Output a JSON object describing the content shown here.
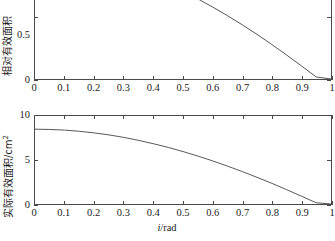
{
  "figure": {
    "background": "#ffffff",
    "line_color": "#555555",
    "axis_color": "#4a4a4a"
  },
  "charts": [
    {
      "id": "top",
      "ylabel": "相对有效面积",
      "xlabel": "",
      "x_ticks": [
        "0",
        "0.1",
        "0.2",
        "0.3",
        "0.4",
        "0.5",
        "0.6",
        "0.7",
        "0.8",
        "0.9",
        "1"
      ],
      "x_tick_values": [
        0,
        0.1,
        0.2,
        0.3,
        0.4,
        0.5,
        0.6,
        0.7,
        0.8,
        0.9,
        1
      ],
      "y_ticks": [
        "0",
        "0.5"
      ],
      "y_tick_values": [
        0,
        0.5
      ],
      "cropped_top": true
    },
    {
      "id": "bottom",
      "ylabel_main": "实际有效面积/cm",
      "ylabel_sup": "2",
      "xlabel_italic": "i",
      "xlabel_rest": "/rad",
      "x_ticks": [
        "0",
        "0.1",
        "0.2",
        "0.3",
        "0.4",
        "0.5",
        "0.6",
        "0.7",
        "0.8",
        "0.9",
        "1"
      ],
      "x_tick_values": [
        0,
        0.1,
        0.2,
        0.3,
        0.4,
        0.5,
        0.6,
        0.7,
        0.8,
        0.9,
        1
      ],
      "y_ticks": [
        "0",
        "5",
        "10"
      ],
      "y_tick_values": [
        0,
        5,
        10
      ],
      "cropped_top": false
    }
  ],
  "chart_data": [
    {
      "type": "line",
      "id": "relative-effective-area",
      "title": "",
      "xlabel": "",
      "ylabel": "相对有效面积",
      "xlim": [
        0,
        1
      ],
      "ylim": [
        0,
        1
      ],
      "grid": false,
      "legend": "none",
      "note": "Top panel is cropped by the screenshot: the plot box extends above the image top edge, so only y ticks 0 and 0.5 are visible.",
      "x": [
        0.0,
        0.05,
        0.1,
        0.15,
        0.2,
        0.25,
        0.3,
        0.35,
        0.4,
        0.45,
        0.5,
        0.55,
        0.6,
        0.65,
        0.7,
        0.75,
        0.8,
        0.85,
        0.9,
        0.95,
        1.0
      ],
      "y": [
        1.0,
        0.997,
        0.988,
        0.972,
        0.951,
        0.923,
        0.89,
        0.851,
        0.806,
        0.756,
        0.701,
        0.641,
        0.576,
        0.507,
        0.434,
        0.357,
        0.276,
        0.192,
        0.105,
        0.016,
        0.0
      ],
      "series": [
        {
          "name": "相对有效面积",
          "values": [
            1.0,
            0.997,
            0.988,
            0.972,
            0.951,
            0.923,
            0.89,
            0.851,
            0.806,
            0.756,
            0.701,
            0.641,
            0.576,
            0.507,
            0.434,
            0.357,
            0.276,
            0.192,
            0.105,
            0.016,
            0.0
          ]
        }
      ]
    },
    {
      "type": "line",
      "id": "actual-effective-area",
      "title": "",
      "xlabel": "i/rad",
      "ylabel": "实际有效面积/cm2",
      "xlim": [
        0,
        1
      ],
      "ylim": [
        0,
        10
      ],
      "grid": false,
      "legend": "none",
      "x": [
        0.0,
        0.05,
        0.1,
        0.15,
        0.2,
        0.25,
        0.3,
        0.35,
        0.4,
        0.45,
        0.5,
        0.55,
        0.6,
        0.65,
        0.7,
        0.75,
        0.8,
        0.85,
        0.9,
        0.95,
        1.0
      ],
      "y": [
        8.5,
        8.47,
        8.4,
        8.26,
        8.08,
        7.85,
        7.57,
        7.23,
        6.85,
        6.43,
        5.96,
        5.45,
        4.9,
        4.31,
        3.69,
        3.03,
        2.35,
        1.63,
        0.89,
        0.14,
        0.0
      ],
      "series": [
        {
          "name": "实际有效面积",
          "values": [
            8.5,
            8.47,
            8.4,
            8.26,
            8.08,
            7.85,
            7.57,
            7.23,
            6.85,
            6.43,
            5.96,
            5.45,
            4.9,
            4.31,
            3.69,
            3.03,
            2.35,
            1.63,
            0.89,
            0.14,
            0.0
          ]
        }
      ]
    }
  ]
}
